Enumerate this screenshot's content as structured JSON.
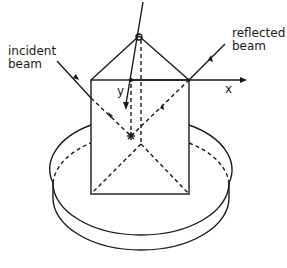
{
  "labels": {
    "incident_line1": "incident",
    "incident_line2": "beam",
    "reflected_line1": "reflected",
    "reflected_line2": "beam",
    "axis_x": "x",
    "axis_y": "y"
  },
  "colors": {
    "stroke": "#1a1a1a",
    "background": "#ffffff"
  }
}
